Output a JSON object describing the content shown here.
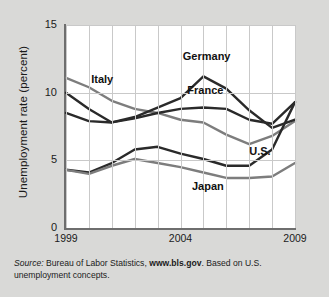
{
  "chart_data": {
    "type": "line",
    "title": "",
    "xlabel": "",
    "ylabel": "Unemployment rate (percent)",
    "xlim": [
      1999,
      2009
    ],
    "ylim": [
      0,
      15
    ],
    "yticks": [
      0,
      5,
      10,
      15
    ],
    "ytick_labels": [
      "0",
      "5",
      "10",
      "15"
    ],
    "xticks": [
      1999,
      2004,
      2009
    ],
    "xtick_labels": [
      "1999",
      "2004",
      "2009"
    ],
    "grid": "both",
    "legend_position": "inline-labels",
    "x": [
      1999,
      2000,
      2001,
      2002,
      2003,
      2004,
      2005,
      2006,
      2007,
      2008,
      2009
    ],
    "series": [
      {
        "name": "Italy",
        "color": "#7d7d7d",
        "values": [
          11.1,
          10.4,
          9.4,
          8.8,
          8.5,
          8.0,
          7.8,
          6.9,
          6.2,
          6.8,
          7.9
        ]
      },
      {
        "name": "Germany",
        "color": "#2a2a2a",
        "values": [
          10.0,
          8.8,
          7.8,
          8.2,
          8.9,
          9.6,
          11.2,
          10.3,
          8.7,
          7.4,
          8.0
        ]
      },
      {
        "name": "France",
        "color": "#2a2a2a",
        "values": [
          8.5,
          7.9,
          7.8,
          8.1,
          8.5,
          8.8,
          8.9,
          8.8,
          8.0,
          7.7,
          9.3
        ]
      },
      {
        "name": "U.S.",
        "color": "#2a2a2a",
        "values": [
          4.3,
          4.1,
          4.8,
          5.8,
          6.0,
          5.5,
          5.1,
          4.6,
          4.6,
          5.8,
          9.3
        ]
      },
      {
        "name": "Japan",
        "color": "#7d7d7d",
        "values": [
          4.3,
          4.0,
          4.6,
          5.1,
          4.8,
          4.5,
          4.1,
          3.7,
          3.7,
          3.8,
          4.8
        ]
      }
    ],
    "annotations": [
      {
        "text": "Italy",
        "x": 2000.1,
        "y": 10.9
      },
      {
        "text": "Germany",
        "x": 2004.1,
        "y": 12.6
      },
      {
        "text": "France",
        "x": 2004.3,
        "y": 10.1
      },
      {
        "text": "U.S.",
        "x": 2007.0,
        "y": 5.6
      },
      {
        "text": "Japan",
        "x": 2004.5,
        "y": 3.0
      }
    ]
  },
  "ylabel_text": "Unemployment rate (percent)",
  "caption": {
    "source_prefix": "Source:",
    "agency": " Bureau of Labor Statistics, ",
    "url": "www.bls.gov",
    "suffix": ". Based on U.S. unemployment concepts."
  }
}
